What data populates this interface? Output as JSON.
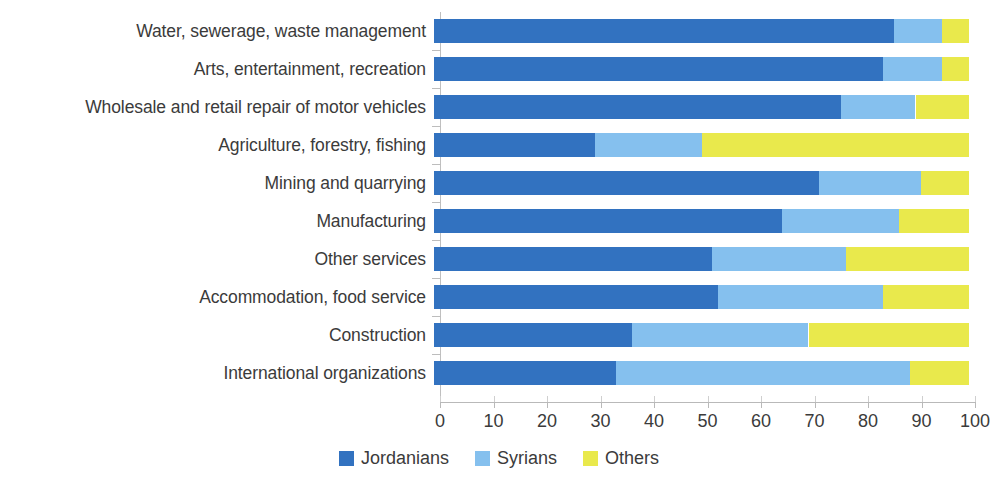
{
  "chart_data": {
    "type": "bar",
    "orientation": "horizontal",
    "stacked": true,
    "stack_total": 100,
    "title": "",
    "subtitle": "",
    "xlabel": "",
    "ylabel": "",
    "xlim": [
      0,
      100
    ],
    "xticks": [
      0,
      10,
      20,
      30,
      40,
      50,
      60,
      70,
      80,
      90,
      100
    ],
    "xtick_labels": [
      "0",
      "10",
      "20",
      "30",
      "40",
      "50",
      "60",
      "70",
      "80",
      "90",
      "100"
    ],
    "grid": false,
    "legend_position": "bottom-center",
    "categories": [
      "Water, sewerage, waste management",
      "Arts, entertainment, recreation",
      "Wholesale and retail repair of motor vehicles",
      "Agriculture, forestry, fishing",
      "Mining and quarrying",
      "Manufacturing",
      "Other services",
      "Accommodation, food service",
      "Construction",
      "International organizations"
    ],
    "series": [
      {
        "name": "Jordanians",
        "color": "#3272c0",
        "values": [
          86,
          84,
          76,
          30,
          72,
          65,
          52,
          53,
          37,
          34
        ]
      },
      {
        "name": "Syrians",
        "color": "#85c0ee",
        "values": [
          9,
          11,
          14,
          20,
          19,
          22,
          25,
          31,
          33,
          55
        ]
      },
      {
        "name": "Others",
        "color": "#e9e94c",
        "values": [
          5,
          5,
          10,
          50,
          9,
          13,
          23,
          16,
          30,
          11
        ]
      }
    ],
    "legend": [
      {
        "label": "Jordanians",
        "color": "#3272c0"
      },
      {
        "label": "Syrians",
        "color": "#85c0ee"
      },
      {
        "label": "Others",
        "color": "#e9e94c"
      }
    ]
  }
}
